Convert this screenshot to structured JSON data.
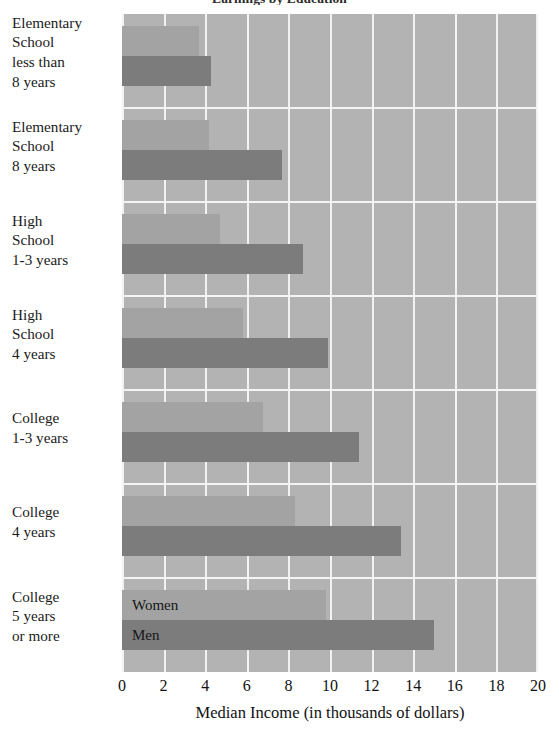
{
  "chart_data": {
    "type": "bar",
    "orientation": "horizontal",
    "title": "Earnings by Education",
    "xlabel": "Median Income (in thousands of dollars)",
    "ylabel": "",
    "xlim": [
      0,
      20
    ],
    "xticks": [
      0,
      2,
      4,
      6,
      8,
      10,
      12,
      14,
      16,
      18,
      20
    ],
    "grid": true,
    "legend_position": "inside-last-group",
    "categories": [
      "Elementary\nSchool\nless than\n8 years",
      "Elementary\nSchool\n8 years",
      "High\nSchool\n1-3 years",
      "High\nSchool\n4 years",
      "College\n1-3 years",
      "College\n4 years",
      "College\n5 years\nor more"
    ],
    "category_lines": [
      [
        "Elementary",
        "School",
        "less than",
        "8 years"
      ],
      [
        "Elementary",
        "School",
        "8 years"
      ],
      [
        "High",
        "School",
        "1-3 years"
      ],
      [
        "High",
        "School",
        "4 years"
      ],
      [
        "College",
        "1-3 years"
      ],
      [
        "College",
        "4 years"
      ],
      [
        "College",
        "5 years",
        "or more"
      ]
    ],
    "series": [
      {
        "name": "Women",
        "color": "#a3a3a3",
        "values": [
          3.7,
          4.2,
          4.7,
          5.8,
          6.8,
          8.3,
          9.8
        ]
      },
      {
        "name": "Men",
        "color": "#7c7c7c",
        "values": [
          4.3,
          7.7,
          8.7,
          9.9,
          11.4,
          13.4,
          15.0
        ]
      }
    ],
    "plot_background": "#b3b3b3",
    "gridline_color": "#f2f2f2"
  },
  "axis": {
    "tick_labels": [
      "0",
      "2",
      "4",
      "6",
      "8",
      "10",
      "12",
      "14",
      "16",
      "18",
      "20"
    ],
    "title": "Median Income (in thousands of dollars)"
  },
  "legend": {
    "women_label": "Women",
    "men_label": "Men"
  },
  "header": {
    "title": "Earnings by Education"
  }
}
